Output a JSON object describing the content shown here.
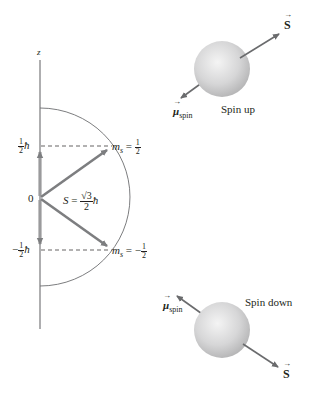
{
  "diagram": {
    "axis": {
      "label": "z"
    },
    "left_panel": {
      "origin_label": "0",
      "upper_level": {
        "value_label": "½ħ",
        "num": "1",
        "den": "2",
        "unit": "ħ",
        "ms_label": "m",
        "ms_sub": "s",
        "ms_value_num": "1",
        "ms_value_den": "2",
        "ms_sign": ""
      },
      "lower_level": {
        "value_label": "−½ħ",
        "sign": "−",
        "num": "1",
        "den": "2",
        "unit": "ħ",
        "ms_label": "m",
        "ms_sub": "s",
        "ms_value_num": "1",
        "ms_value_den": "2",
        "ms_sign": "−"
      },
      "magnitude": {
        "symbol": "S",
        "equals": "=",
        "num": "√3",
        "den": "2",
        "unit": "ħ"
      }
    },
    "spin_up": {
      "caption": "Spin up",
      "spin_vector_label": "S",
      "moment_label": "μ",
      "moment_sub": "spin"
    },
    "spin_down": {
      "caption": "Spin down",
      "spin_vector_label": "S",
      "moment_label": "μ",
      "moment_sub": "spin"
    },
    "colors": {
      "axis": "#9a9a9c",
      "vector": "#7d7e80",
      "sphere_light": "#f2f2f2",
      "sphere_dark": "#b9b9ba",
      "circle": "#6d6e70",
      "text": "#231f20"
    }
  }
}
